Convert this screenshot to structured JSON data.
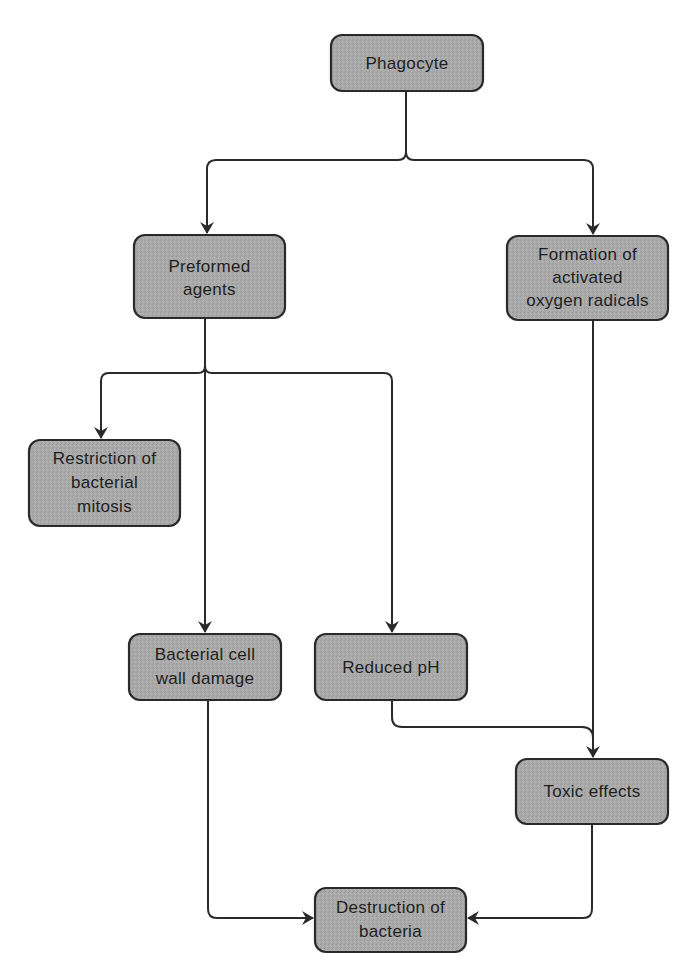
{
  "diagram": {
    "type": "flowchart",
    "colors": {
      "node_fill": "#a9a9a9",
      "node_stroke": "#2a2a2a",
      "edge": "#2a2a2a",
      "text": "#1e1e1e",
      "background": "#ffffff"
    },
    "nodes": [
      {
        "id": "phagocyte",
        "lines": [
          "Phagocyte"
        ],
        "x": 331,
        "y": 35,
        "w": 152,
        "h": 56
      },
      {
        "id": "preformed_agents",
        "lines": [
          "Preformed",
          "agents"
        ],
        "x": 134,
        "y": 235,
        "w": 151,
        "h": 83
      },
      {
        "id": "oxygen_radicals",
        "lines": [
          "Formation of",
          "activated",
          "oxygen radicals"
        ],
        "x": 507,
        "y": 236,
        "w": 161,
        "h": 84
      },
      {
        "id": "restriction_mitosis",
        "lines": [
          "Restriction of",
          "bacterial",
          "mitosis"
        ],
        "x": 29,
        "y": 440,
        "w": 151,
        "h": 86
      },
      {
        "id": "cell_wall_damage",
        "lines": [
          "Bacterial cell",
          "wall damage"
        ],
        "x": 129,
        "y": 634,
        "w": 152,
        "h": 66
      },
      {
        "id": "reduced_ph",
        "lines": [
          "Reduced pH"
        ],
        "x": 315,
        "y": 634,
        "w": 152,
        "h": 66
      },
      {
        "id": "toxic_effects",
        "lines": [
          "Toxic effects"
        ],
        "x": 516,
        "y": 759,
        "w": 152,
        "h": 65
      },
      {
        "id": "destruction",
        "lines": [
          "Destruction of",
          "bacteria"
        ],
        "x": 315,
        "y": 888,
        "w": 151,
        "h": 64
      }
    ],
    "edges": [
      {
        "from": "phagocyte",
        "to": "preformed_agents"
      },
      {
        "from": "phagocyte",
        "to": "oxygen_radicals"
      },
      {
        "from": "preformed_agents",
        "to": "restriction_mitosis"
      },
      {
        "from": "preformed_agents",
        "to": "cell_wall_damage"
      },
      {
        "from": "preformed_agents",
        "to": "reduced_ph"
      },
      {
        "from": "oxygen_radicals",
        "to": "toxic_effects"
      },
      {
        "from": "reduced_ph",
        "to": "toxic_effects"
      },
      {
        "from": "cell_wall_damage",
        "to": "destruction"
      },
      {
        "from": "toxic_effects",
        "to": "destruction"
      }
    ]
  }
}
